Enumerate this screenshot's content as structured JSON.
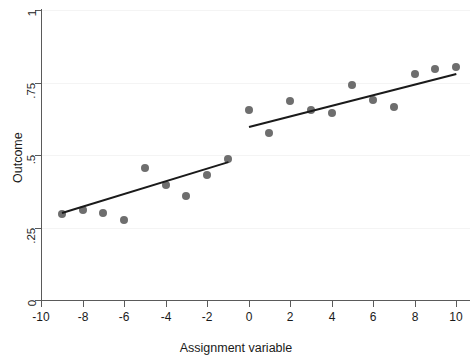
{
  "chart_data": {
    "type": "scatter",
    "title": "",
    "xlabel": "Assignment variable",
    "ylabel": "Outcome",
    "xlim": [
      -10,
      10
    ],
    "ylim": [
      0,
      1
    ],
    "xticks": [
      -10,
      -8,
      -6,
      -4,
      -2,
      0,
      2,
      4,
      6,
      8,
      10
    ],
    "xticklabels": [
      "-10",
      "-8",
      "-6",
      "-4",
      "-2",
      "0",
      "2",
      "4",
      "6",
      "8",
      "10"
    ],
    "yticks": [
      0,
      0.25,
      0.5,
      0.75,
      1
    ],
    "yticklabels": [
      "0",
      ".25",
      ".5",
      ".75",
      "1"
    ],
    "grid": "horizontal-faint",
    "legend": "none",
    "cutoff": 0,
    "point_color": "#6e6e6e",
    "line_color": "#1a1a1a",
    "series": [
      {
        "name": "Left of cutoff (control)",
        "points": [
          {
            "x": -9,
            "y": 0.295
          },
          {
            "x": -8,
            "y": 0.31
          },
          {
            "x": -7,
            "y": 0.3
          },
          {
            "x": -6,
            "y": 0.275
          },
          {
            "x": -5,
            "y": 0.455
          },
          {
            "x": -4,
            "y": 0.395
          },
          {
            "x": -3,
            "y": 0.36
          },
          {
            "x": -2,
            "y": 0.43
          },
          {
            "x": -1,
            "y": 0.485
          }
        ]
      },
      {
        "name": "Right of cutoff (treated)",
        "points": [
          {
            "x": 0,
            "y": 0.655
          },
          {
            "x": 1,
            "y": 0.575
          },
          {
            "x": 2,
            "y": 0.685
          },
          {
            "x": 3,
            "y": 0.655
          },
          {
            "x": 4,
            "y": 0.645
          },
          {
            "x": 5,
            "y": 0.74
          },
          {
            "x": 6,
            "y": 0.69
          },
          {
            "x": 7,
            "y": 0.665
          },
          {
            "x": 8,
            "y": 0.78
          },
          {
            "x": 9,
            "y": 0.795
          },
          {
            "x": 10,
            "y": 0.805
          }
        ]
      }
    ],
    "fit_lines": [
      {
        "name": "left-fit",
        "x0": -9,
        "y0": 0.305,
        "x1": -1,
        "y1": 0.48
      },
      {
        "name": "right-fit",
        "x0": 0,
        "y0": 0.6,
        "x1": 10,
        "y1": 0.783
      }
    ]
  }
}
